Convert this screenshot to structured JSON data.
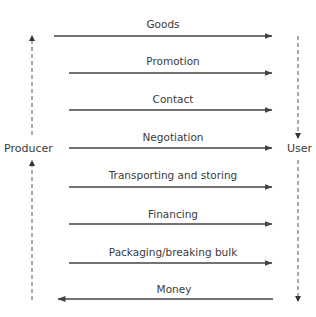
{
  "diagram": {
    "parties": {
      "left": "Producer",
      "right": "User"
    },
    "flows": [
      {
        "label": "Goods",
        "direction": "right"
      },
      {
        "label": "Promotion",
        "direction": "right"
      },
      {
        "label": "Contact",
        "direction": "right"
      },
      {
        "label": "Negotiation",
        "direction": "right"
      },
      {
        "label": "Transporting and storing",
        "direction": "right"
      },
      {
        "label": "Financing",
        "direction": "right"
      },
      {
        "label": "Packaging/breaking bulk",
        "direction": "right"
      },
      {
        "label": "Money",
        "direction": "left"
      }
    ],
    "colors": {
      "line": "#444444",
      "text": "#3a3a3a",
      "dashed": "#555555"
    }
  }
}
